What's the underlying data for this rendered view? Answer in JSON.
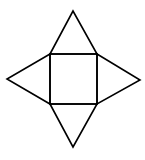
{
  "diagram": {
    "type": "square-pyramid-net",
    "background": "#ffffff",
    "stroke_color": "#000000",
    "stroke_width": 1.6,
    "square": {
      "x": 50,
      "y": 54,
      "width": 47,
      "height": 50
    },
    "triangles": {
      "top": "50,54 73,11 97,54",
      "right": "97,54 140,80 97,104",
      "bottom": "50,104 73,147 97,104",
      "left": "50,54 7,79 50,104"
    }
  }
}
